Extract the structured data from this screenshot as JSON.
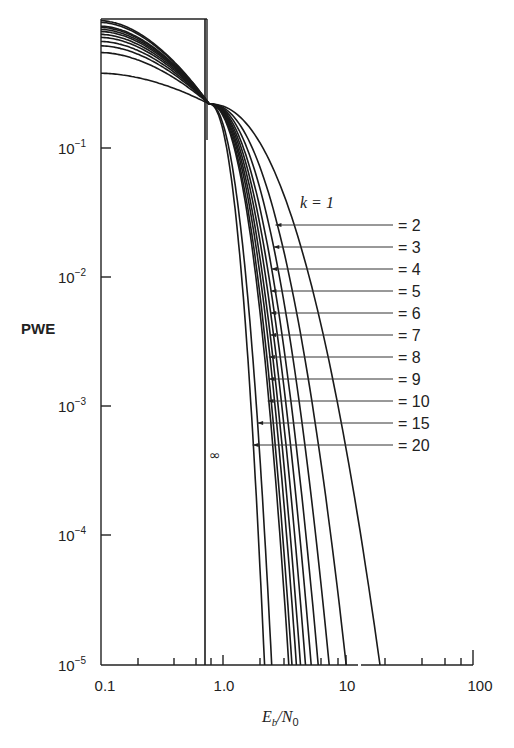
{
  "chart_data": {
    "type": "line",
    "title": "",
    "xlabel": "E_b/N_0",
    "ylabel": "PWE",
    "xscale": "log",
    "yscale": "log",
    "xlim": [
      0.1,
      100
    ],
    "ylim": [
      1e-05,
      1
    ],
    "x_ticks": [
      "0.1",
      "1.0",
      "10",
      "100"
    ],
    "y_ticks": [
      "10^-1",
      "10^-2",
      "10^-3",
      "10^-4",
      "10^-5"
    ],
    "grid": false,
    "legend": "inline leader-line labels at right",
    "annotations": [
      "k = 1",
      "= 2",
      "= 3",
      "= 4",
      "= 5",
      "= 6",
      "= 7",
      "= 8",
      "= 9",
      "= 10",
      "= 15",
      "= 20",
      "∞"
    ],
    "limit_curve": {
      "name": "k = ∞",
      "x_threshold": 0.69,
      "description": "step at ln2 ≈ 0.69 (Shannon limit)"
    },
    "common_crossing": {
      "x": 0.75,
      "y": 0.22
    },
    "series": [
      {
        "name": "k = 1",
        "y_at_x0.1": 0.38,
        "x_at_1e-5": 18.0
      },
      {
        "name": "k = 2",
        "y_at_x0.1": 0.55,
        "x_at_1e-5": 9.6
      },
      {
        "name": "k = 3",
        "y_at_x0.1": 0.62,
        "x_at_1e-5": 7.0
      },
      {
        "name": "k = 4",
        "y_at_x0.1": 0.67,
        "x_at_1e-5": 5.7
      },
      {
        "name": "k = 5",
        "y_at_x0.1": 0.72,
        "x_at_1e-5": 5.0
      },
      {
        "name": "k = 6",
        "y_at_x0.1": 0.76,
        "x_at_1e-5": 4.5
      },
      {
        "name": "k = 7",
        "y_at_x0.1": 0.8,
        "x_at_1e-5": 4.1
      },
      {
        "name": "k = 8",
        "y_at_x0.1": 0.83,
        "x_at_1e-5": 3.8
      },
      {
        "name": "k = 9",
        "y_at_x0.1": 0.86,
        "x_at_1e-5": 3.5
      },
      {
        "name": "k = 10",
        "y_at_x0.1": 0.88,
        "x_at_1e-5": 3.3
      },
      {
        "name": "k = 15",
        "y_at_x0.1": 0.94,
        "x_at_1e-5": 2.4
      },
      {
        "name": "k = 20",
        "y_at_x0.1": 0.97,
        "x_at_1e-5": 2.1
      }
    ]
  },
  "labels": {
    "y_axis": "PWE",
    "x_axis_main": "E",
    "x_axis_sub1": "b",
    "x_axis_mid": "/N",
    "x_axis_sub2": "0",
    "x_ticks": [
      "0.1",
      "1.0",
      "10",
      "100"
    ],
    "y_tick_base": "10",
    "y_tick_exps": [
      "−1",
      "−2",
      "−3",
      "−4",
      "−5"
    ],
    "k_first": "k = 1",
    "k_rest": [
      "= 2",
      "= 3",
      "= 4",
      "= 5",
      "= 6",
      "= 7",
      "= 8",
      "= 9",
      "= 10",
      "= 15",
      "= 20"
    ],
    "infinity": "∞"
  }
}
